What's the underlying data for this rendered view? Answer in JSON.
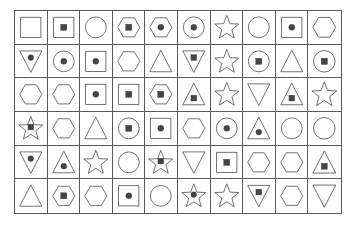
{
  "image": {
    "title": "Shape grid puzzle",
    "description": "A 10 column by 6 row grid of outlined geometric shapes, some containing a smaller filled shape",
    "columns": 10,
    "rows": 6,
    "background_color": "#ffffff",
    "grid_line_color": "#5a5a5a",
    "outline_color": "#2b2b2b",
    "fill_color": "#454545"
  },
  "legend": {
    "outer_shape_names": [
      "square",
      "circle",
      "hexagon",
      "triangle-up",
      "triangle-down",
      "star"
    ],
    "inner_shape_names": [
      "none",
      "square",
      "circle"
    ]
  },
  "cells": [
    {
      "row": 1,
      "col": 1,
      "outer": "square",
      "inner": "none"
    },
    {
      "row": 1,
      "col": 2,
      "outer": "square",
      "inner": "square"
    },
    {
      "row": 1,
      "col": 3,
      "outer": "circle",
      "inner": "none"
    },
    {
      "row": 1,
      "col": 4,
      "outer": "hexagon",
      "inner": "square"
    },
    {
      "row": 1,
      "col": 5,
      "outer": "hexagon",
      "inner": "circle"
    },
    {
      "row": 1,
      "col": 6,
      "outer": "circle",
      "inner": "circle"
    },
    {
      "row": 1,
      "col": 7,
      "outer": "star",
      "inner": "none"
    },
    {
      "row": 1,
      "col": 8,
      "outer": "circle",
      "inner": "none"
    },
    {
      "row": 1,
      "col": 9,
      "outer": "square",
      "inner": "circle"
    },
    {
      "row": 1,
      "col": 10,
      "outer": "hexagon",
      "inner": "none"
    },
    {
      "row": 2,
      "col": 1,
      "outer": "triangle-down",
      "inner": "circle"
    },
    {
      "row": 2,
      "col": 2,
      "outer": "circle",
      "inner": "circle"
    },
    {
      "row": 2,
      "col": 3,
      "outer": "square",
      "inner": "circle"
    },
    {
      "row": 2,
      "col": 4,
      "outer": "hexagon",
      "inner": "none"
    },
    {
      "row": 2,
      "col": 5,
      "outer": "triangle-up",
      "inner": "none"
    },
    {
      "row": 2,
      "col": 6,
      "outer": "triangle-down",
      "inner": "square"
    },
    {
      "row": 2,
      "col": 7,
      "outer": "star",
      "inner": "none"
    },
    {
      "row": 2,
      "col": 8,
      "outer": "circle",
      "inner": "square"
    },
    {
      "row": 2,
      "col": 9,
      "outer": "triangle-up",
      "inner": "none"
    },
    {
      "row": 2,
      "col": 10,
      "outer": "circle",
      "inner": "square"
    },
    {
      "row": 3,
      "col": 1,
      "outer": "hexagon",
      "inner": "none"
    },
    {
      "row": 3,
      "col": 2,
      "outer": "hexagon",
      "inner": "none"
    },
    {
      "row": 3,
      "col": 3,
      "outer": "square",
      "inner": "circle"
    },
    {
      "row": 3,
      "col": 4,
      "outer": "square",
      "inner": "square"
    },
    {
      "row": 3,
      "col": 5,
      "outer": "hexagon",
      "inner": "square"
    },
    {
      "row": 3,
      "col": 6,
      "outer": "triangle-up",
      "inner": "square"
    },
    {
      "row": 3,
      "col": 7,
      "outer": "star",
      "inner": "none"
    },
    {
      "row": 3,
      "col": 8,
      "outer": "triangle-down",
      "inner": "none"
    },
    {
      "row": 3,
      "col": 9,
      "outer": "triangle-up",
      "inner": "square"
    },
    {
      "row": 3,
      "col": 10,
      "outer": "star",
      "inner": "none"
    },
    {
      "row": 4,
      "col": 1,
      "outer": "star",
      "inner": "square"
    },
    {
      "row": 4,
      "col": 2,
      "outer": "hexagon",
      "inner": "none"
    },
    {
      "row": 4,
      "col": 3,
      "outer": "triangle-up",
      "inner": "none"
    },
    {
      "row": 4,
      "col": 4,
      "outer": "circle",
      "inner": "square"
    },
    {
      "row": 4,
      "col": 5,
      "outer": "square",
      "inner": "circle"
    },
    {
      "row": 4,
      "col": 6,
      "outer": "hexagon",
      "inner": "none"
    },
    {
      "row": 4,
      "col": 7,
      "outer": "circle",
      "inner": "circle"
    },
    {
      "row": 4,
      "col": 8,
      "outer": "triangle-up",
      "inner": "circle"
    },
    {
      "row": 4,
      "col": 9,
      "outer": "circle",
      "inner": "none"
    },
    {
      "row": 4,
      "col": 10,
      "outer": "circle",
      "inner": "none"
    },
    {
      "row": 5,
      "col": 1,
      "outer": "triangle-down",
      "inner": "circle"
    },
    {
      "row": 5,
      "col": 2,
      "outer": "triangle-up",
      "inner": "circle"
    },
    {
      "row": 5,
      "col": 3,
      "outer": "star",
      "inner": "none"
    },
    {
      "row": 5,
      "col": 4,
      "outer": "circle",
      "inner": "none"
    },
    {
      "row": 5,
      "col": 5,
      "outer": "star",
      "inner": "square"
    },
    {
      "row": 5,
      "col": 6,
      "outer": "triangle-down",
      "inner": "none"
    },
    {
      "row": 5,
      "col": 7,
      "outer": "square",
      "inner": "square"
    },
    {
      "row": 5,
      "col": 8,
      "outer": "hexagon",
      "inner": "none"
    },
    {
      "row": 5,
      "col": 9,
      "outer": "hexagon",
      "inner": "none"
    },
    {
      "row": 5,
      "col": 10,
      "outer": "triangle-up",
      "inner": "square"
    },
    {
      "row": 6,
      "col": 1,
      "outer": "triangle-up",
      "inner": "none"
    },
    {
      "row": 6,
      "col": 2,
      "outer": "hexagon",
      "inner": "square"
    },
    {
      "row": 6,
      "col": 3,
      "outer": "hexagon",
      "inner": "none"
    },
    {
      "row": 6,
      "col": 4,
      "outer": "square",
      "inner": "circle"
    },
    {
      "row": 6,
      "col": 5,
      "outer": "circle",
      "inner": "none"
    },
    {
      "row": 6,
      "col": 6,
      "outer": "star",
      "inner": "circle"
    },
    {
      "row": 6,
      "col": 7,
      "outer": "star",
      "inner": "none"
    },
    {
      "row": 6,
      "col": 8,
      "outer": "triangle-down",
      "inner": "square"
    },
    {
      "row": 6,
      "col": 9,
      "outer": "hexagon",
      "inner": "none"
    },
    {
      "row": 6,
      "col": 10,
      "outer": "triangle-down",
      "inner": "none"
    }
  ]
}
